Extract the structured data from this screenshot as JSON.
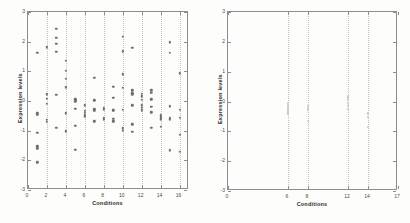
{
  "figure": {
    "panels": [
      "left-scatter-panel",
      "right-scatter-panel"
    ],
    "marker_color": "#6f6f6f",
    "axis_color": "#8d8d8d",
    "grid_color": "#c2c2c2",
    "background": "#fdfdfc"
  },
  "chart_data": [
    {
      "type": "scatter",
      "name": "all-conditions-expression-scatter",
      "title": "",
      "xlabel": "Conditions",
      "ylabel": "Expression levels",
      "xlim": [
        0,
        17
      ],
      "ylim": [
        -3,
        3
      ],
      "xticks": [
        0,
        2,
        4,
        6,
        8,
        10,
        12,
        14,
        16
      ],
      "xticklabels": [
        "0",
        "2",
        "4",
        "6",
        "8",
        "10",
        "12",
        "14",
        "16"
      ],
      "yticks": [
        -3,
        -2,
        -1,
        0,
        1,
        2,
        3
      ],
      "yticklabels": [
        "-3",
        "-2",
        "-1",
        "0",
        "1",
        "2",
        "3"
      ],
      "grid": "vertical-dotted",
      "legend": "none",
      "marker": "dot",
      "points": [
        [
          1,
          1.62
        ],
        [
          1,
          -0.42
        ],
        [
          1,
          -0.46
        ],
        [
          1,
          -1.08
        ],
        [
          1,
          -1.53
        ],
        [
          1,
          -1.6
        ],
        [
          1,
          -2.07
        ],
        [
          2,
          1.82
        ],
        [
          2,
          1.8
        ],
        [
          2,
          0.22
        ],
        [
          2,
          0.08
        ],
        [
          2,
          -0.1
        ],
        [
          2,
          -0.64
        ],
        [
          2,
          -0.7
        ],
        [
          3,
          2.44
        ],
        [
          3,
          2.12
        ],
        [
          3,
          1.92
        ],
        [
          3,
          1.66
        ],
        [
          3,
          0.2
        ],
        [
          3,
          -0.9
        ],
        [
          4,
          1.36
        ],
        [
          4,
          1.02
        ],
        [
          4,
          0.74
        ],
        [
          4,
          0.46
        ],
        [
          4,
          -0.42
        ],
        [
          4,
          -1.02
        ],
        [
          5,
          0.06
        ],
        [
          5,
          0.02
        ],
        [
          5,
          -0.02
        ],
        [
          5,
          -0.26
        ],
        [
          5,
          -0.84
        ],
        [
          5,
          -1.64
        ],
        [
          6,
          -0.12
        ],
        [
          6,
          -0.16
        ],
        [
          6,
          -0.34
        ],
        [
          6,
          -0.4
        ],
        [
          6,
          -0.48
        ],
        [
          6,
          -0.52
        ],
        [
          7,
          0.78
        ],
        [
          7,
          0.02
        ],
        [
          7,
          -0.28
        ],
        [
          7,
          -0.34
        ],
        [
          7,
          -0.68
        ],
        [
          8,
          -0.22
        ],
        [
          8,
          -0.26
        ],
        [
          8,
          -0.3
        ],
        [
          8,
          -0.56
        ],
        [
          8,
          -0.6
        ],
        [
          8,
          -0.64
        ],
        [
          9,
          0.48
        ],
        [
          9,
          0.1
        ],
        [
          9,
          -0.3
        ],
        [
          9,
          -0.34
        ],
        [
          9,
          -0.6
        ],
        [
          9,
          -0.66
        ],
        [
          9,
          -0.7
        ],
        [
          10,
          2.16
        ],
        [
          10,
          1.68
        ],
        [
          10,
          0.9
        ],
        [
          10,
          0.44
        ],
        [
          10,
          -0.3
        ],
        [
          10,
          -0.92
        ],
        [
          10,
          -1.0
        ],
        [
          11,
          1.8
        ],
        [
          11,
          0.36
        ],
        [
          11,
          0.26
        ],
        [
          11,
          0.22
        ],
        [
          11,
          -0.14
        ],
        [
          11,
          -0.78
        ],
        [
          11,
          -1.04
        ],
        [
          12,
          0.24
        ],
        [
          12,
          0.16
        ],
        [
          12,
          0.04
        ],
        [
          12,
          -0.14
        ],
        [
          12,
          -0.22
        ],
        [
          12,
          -0.32
        ],
        [
          13,
          0.36
        ],
        [
          13,
          0.28
        ],
        [
          13,
          0.06
        ],
        [
          13,
          -0.2
        ],
        [
          13,
          -0.38
        ],
        [
          13,
          -0.9
        ],
        [
          14,
          -0.48
        ],
        [
          14,
          -0.54
        ],
        [
          14,
          -0.58
        ],
        [
          14,
          -0.62
        ],
        [
          14,
          -0.86
        ],
        [
          15,
          1.98
        ],
        [
          15,
          1.62
        ],
        [
          15,
          -0.18
        ],
        [
          15,
          -0.56
        ],
        [
          15,
          -0.62
        ],
        [
          15,
          -1.66
        ],
        [
          16,
          0.94
        ],
        [
          16,
          -0.3
        ],
        [
          16,
          -0.56
        ],
        [
          16,
          -1.14
        ],
        [
          16,
          -1.72
        ]
      ]
    },
    {
      "type": "scatter",
      "name": "selected-conditions-expression-scatter",
      "title": "",
      "xlabel": "Conditions",
      "ylabel": "Expression levels",
      "xlim": [
        0,
        17
      ],
      "ylim": [
        -3,
        3
      ],
      "xticks": [
        0,
        6,
        8,
        12,
        14,
        17
      ],
      "xticklabels": [
        "0",
        "6",
        "8",
        "12",
        "14",
        "17"
      ],
      "yticks": [
        -3,
        -2,
        -1,
        0,
        1,
        2,
        3
      ],
      "yticklabels": [
        "-3",
        "-2",
        "-1",
        "0",
        "1",
        "2",
        "3"
      ],
      "grid": "vertical-dotted",
      "legend": "none",
      "marker": "dot",
      "points": [
        [
          6,
          -0.06
        ],
        [
          6,
          -0.12
        ],
        [
          6,
          -0.2
        ],
        [
          6,
          -0.3
        ],
        [
          6,
          -0.34
        ],
        [
          6,
          -0.4
        ],
        [
          8,
          -0.16
        ],
        [
          8,
          -0.22
        ],
        [
          8,
          -0.28
        ],
        [
          8,
          -0.64
        ],
        [
          12,
          0.2
        ],
        [
          12,
          0.14
        ],
        [
          12,
          0.04
        ],
        [
          12,
          -0.06
        ],
        [
          12,
          -0.14
        ],
        [
          12,
          -0.24
        ],
        [
          14,
          -0.4
        ],
        [
          14,
          -0.52
        ],
        [
          14,
          -0.84
        ]
      ]
    }
  ]
}
